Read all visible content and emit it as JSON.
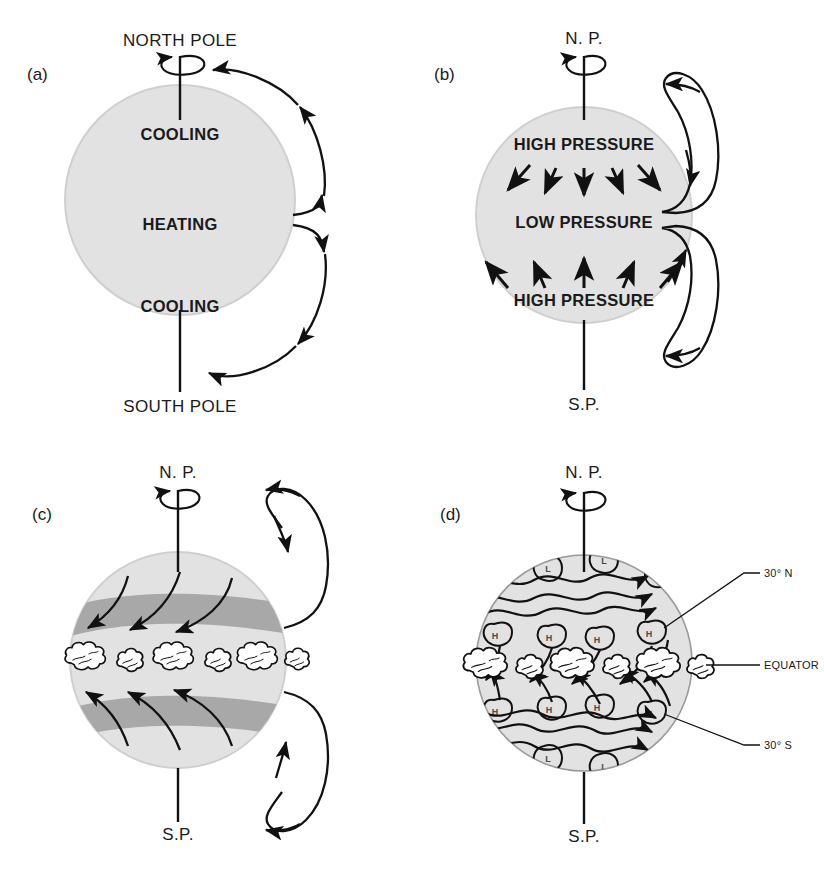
{
  "figure": {
    "background": "#ffffff",
    "globe_fill": "#e2e2e2",
    "globe_stroke": "#cfcfcf",
    "band_fill": "#a8a8a8",
    "line_color": "#111111",
    "cloud_fill": "#ffffff",
    "cell_text_color": "#4a4a4a"
  },
  "panels": [
    {
      "id": "a",
      "label": "(a)",
      "north_label": "NORTH POLE",
      "south_label": "SOUTH POLE",
      "zones": [
        {
          "text": "COOLING"
        },
        {
          "text": "HEATING"
        },
        {
          "text": "COOLING"
        }
      ]
    },
    {
      "id": "b",
      "label": "(b)",
      "north_label": "N. P.",
      "south_label": "S.P.",
      "zones": [
        {
          "text": "HIGH PRESSURE"
        },
        {
          "text": "LOW PRESSURE"
        },
        {
          "text": "HIGH PRESSURE"
        }
      ],
      "arrow_count_per_band": 5
    },
    {
      "id": "c",
      "label": "(c)",
      "north_label": "N. P.",
      "south_label": "S.P.",
      "cloud_count": 6,
      "band_count": 2,
      "curved_flow_lines_per_band": 3
    },
    {
      "id": "d",
      "label": "(d)",
      "north_label": "N. P.",
      "south_label": "S.P.",
      "cloud_count": 6,
      "side_labels": [
        {
          "text": "30° N"
        },
        {
          "text": "EQUATOR"
        },
        {
          "text": "30° S"
        }
      ],
      "pressure_cells": {
        "north_low": [
          "L",
          "L"
        ],
        "north_high": [
          "H",
          "H",
          "H",
          "H"
        ],
        "south_high": [
          "H",
          "H",
          "H",
          "H"
        ],
        "south_low": [
          "L",
          "L"
        ]
      }
    }
  ]
}
